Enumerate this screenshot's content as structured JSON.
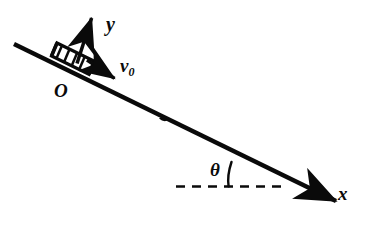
{
  "figure": {
    "type": "physics-free-body-diagram",
    "background_color": "#ffffff",
    "stroke_color": "#0a0a0a",
    "canvas": {
      "width": 375,
      "height": 228
    }
  },
  "labels": {
    "y_axis": "y",
    "x_axis": "x",
    "origin": "O",
    "initial_velocity": "v",
    "initial_velocity_subscript": "0",
    "incline_angle": "θ"
  },
  "elements": {
    "incline_line": {
      "name": "incline-surface",
      "from": [
        14,
        44
      ],
      "to": [
        350,
        208
      ],
      "angle_degrees": 26,
      "stroke_width": 4.2
    },
    "x_axis_arrow": {
      "name": "x-axis-arrow",
      "tip": [
        350,
        208
      ],
      "direction": "down-right along incline"
    },
    "y_axis_arrow": {
      "name": "y-axis-arrow",
      "from": [
        78,
        62
      ],
      "to": [
        93,
        13
      ],
      "direction": "up, perpendicular to incline",
      "stroke_width": 3.4
    },
    "velocity_arrow": {
      "name": "initial-velocity-arrow",
      "from": [
        88,
        61
      ],
      "to": [
        121,
        83
      ],
      "direction": "down-right along incline",
      "stroke_width": 3.4
    },
    "block": {
      "name": "sliding-block",
      "shape": "hatched parallelogram resting on incline",
      "hatch_count": 4,
      "center": [
        76,
        58
      ]
    },
    "point_marker": {
      "name": "incline-point-marker",
      "position": [
        164,
        122
      ]
    },
    "horizontal_dashed_line": {
      "name": "horizontal-reference-line",
      "from": [
        176,
        186
      ],
      "to": [
        283,
        186
      ],
      "style": "dashed",
      "dash_pattern": "9 7"
    },
    "angle_arc": {
      "name": "incline-angle-arc",
      "vertex": [
        283,
        186
      ],
      "radius": 56,
      "between": [
        "horizontal-reference-line",
        "incline-surface"
      ]
    }
  }
}
